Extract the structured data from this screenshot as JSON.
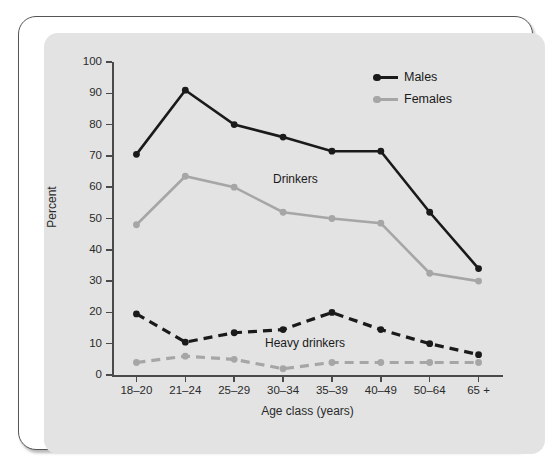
{
  "chart_data": {
    "type": "line",
    "title": "",
    "xlabel": "Age class (years)",
    "ylabel": "Percent",
    "ylim": [
      0,
      100
    ],
    "ytick_labels": [
      "0",
      "10",
      "20",
      "30",
      "40",
      "50",
      "60",
      "70",
      "80",
      "90",
      "100"
    ],
    "yticks": [
      0,
      10,
      20,
      30,
      40,
      50,
      60,
      70,
      80,
      90,
      100
    ],
    "grid": false,
    "legend_position": "top-right",
    "categories": [
      "18–20",
      "21–24",
      "25–29",
      "30–34",
      "35–39",
      "40–49",
      "50–64",
      "65 +"
    ],
    "legend": [
      {
        "name": "Males",
        "color": "#1a1a1a"
      },
      {
        "name": "Females",
        "color": "#a6a6a6"
      }
    ],
    "annotations": [
      {
        "text": "Drinkers",
        "x_category": "30–34",
        "y_value": 67
      },
      {
        "text": "Heavy drinkers",
        "x_category": "30–34",
        "y_value": 15
      }
    ],
    "series": [
      {
        "name": "Males",
        "group": "Drinkers",
        "color": "#1a1a1a",
        "style": "solid",
        "values": [
          70.5,
          91,
          80,
          76,
          71.5,
          71.5,
          52,
          34
        ]
      },
      {
        "name": "Females",
        "group": "Drinkers",
        "color": "#a6a6a6",
        "style": "solid",
        "values": [
          48,
          63.5,
          60,
          52,
          50,
          48.5,
          32.5,
          30
        ]
      },
      {
        "name": "Males",
        "group": "Heavy drinkers",
        "color": "#1a1a1a",
        "style": "dashed",
        "values": [
          19.5,
          10.5,
          13.5,
          14.5,
          20,
          14.5,
          10,
          6.5
        ]
      },
      {
        "name": "Females",
        "group": "Heavy drinkers",
        "color": "#a6a6a6",
        "style": "dashed",
        "values": [
          4,
          6,
          5,
          2,
          4,
          4,
          4,
          4
        ]
      }
    ]
  }
}
